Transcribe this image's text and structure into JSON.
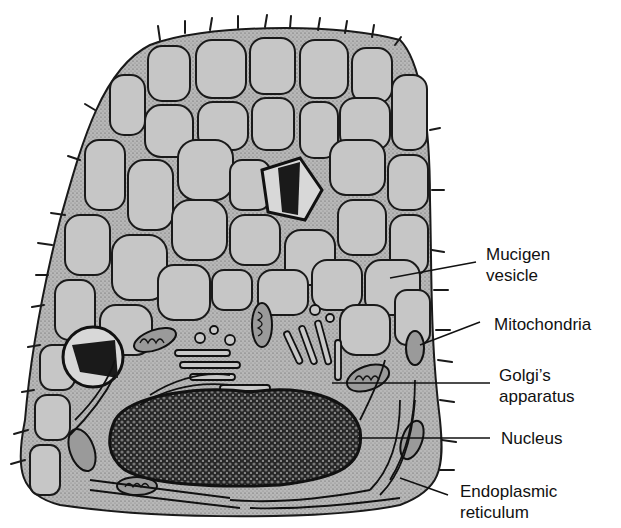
{
  "diagram": {
    "labels": [
      {
        "id": "mucigen-vesicle",
        "line1": "Mucigen",
        "line2": "vesicle"
      },
      {
        "id": "mitochondria",
        "line1": "Mitochondria",
        "line2": ""
      },
      {
        "id": "golgi-apparatus",
        "line1": "Golgi’s",
        "line2": "apparatus"
      },
      {
        "id": "nucleus",
        "line1": "Nucleus",
        "line2": ""
      },
      {
        "id": "endoplasmic-reticulum",
        "line1": "Endoplasmic",
        "line2": "reticulum"
      }
    ]
  },
  "colors": {
    "cytoplasm": "#b4b4b4",
    "vesicle": "#c8c8c8",
    "outline": "#1a1a1a",
    "nucleus_dark": "#1c1c1c",
    "nucleus_chromatin": "#6e6e6e"
  }
}
